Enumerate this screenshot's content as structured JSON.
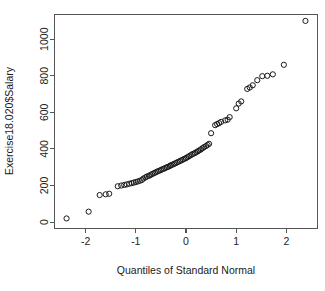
{
  "figure": {
    "background_color": "#ffffff",
    "axis_color": "#555555",
    "point_color": "#1a1a1a",
    "point_radius_px": 2.6
  },
  "axes": {
    "y_title": "Exercise18.020$Salary",
    "x_title": "Quantiles of Standard Normal",
    "x_ticks": [
      "-2",
      "-1",
      "0",
      "1",
      "2"
    ],
    "y_ticks": [
      "0",
      "200",
      "400",
      "600",
      "800",
      "1000"
    ]
  },
  "chart_data": {
    "type": "scatter",
    "title": "",
    "subtitle": "",
    "xlabel": "Quantiles of Standard Normal",
    "ylabel": "Exercise18.020$Salary",
    "xlim": [
      -2.62,
      2.62
    ],
    "ylim": [
      -35,
      1135
    ],
    "xticks": [
      -2,
      -1,
      0,
      1,
      2
    ],
    "yticks": [
      0,
      200,
      400,
      600,
      800,
      1000
    ],
    "grid": false,
    "legend": null,
    "marker": "open-circle",
    "annotations": [],
    "series": [
      {
        "name": "Salary quantiles",
        "n_points": 73,
        "x": [
          -2.38,
          -1.94,
          -1.72,
          -1.6,
          -1.53,
          -1.36,
          -1.29,
          -1.23,
          -1.18,
          -1.13,
          -1.08,
          -1.04,
          -1.0,
          -0.96,
          -0.92,
          -0.88,
          -0.85,
          -0.81,
          -0.78,
          -0.74,
          -0.71,
          -0.68,
          -0.65,
          -0.62,
          -0.59,
          -0.56,
          -0.53,
          -0.5,
          -0.47,
          -0.44,
          -0.41,
          -0.38,
          -0.35,
          -0.32,
          -0.3,
          -0.27,
          -0.24,
          -0.21,
          -0.18,
          -0.15,
          -0.12,
          -0.09,
          -0.06,
          -0.03,
          0.0,
          0.03,
          0.06,
          0.09,
          0.12,
          0.15,
          0.18,
          0.21,
          0.24,
          0.27,
          0.3,
          0.33,
          0.36,
          0.4,
          0.43,
          0.46,
          0.5,
          0.58,
          0.62,
          0.66,
          0.7,
          0.78,
          0.83,
          0.87,
          1.0,
          1.05,
          1.1,
          1.22,
          1.27,
          1.33,
          1.42,
          1.52,
          1.62,
          1.73,
          1.95,
          2.38
        ],
        "y": [
          20,
          57,
          148,
          152,
          155,
          196,
          200,
          203,
          206,
          210,
          213,
          216,
          219,
          222,
          226,
          230,
          238,
          244,
          249,
          253,
          257,
          262,
          266,
          270,
          274,
          278,
          281,
          285,
          289,
          292,
          296,
          300,
          303,
          307,
          311,
          314,
          318,
          322,
          326,
          330,
          334,
          338,
          342,
          346,
          350,
          355,
          360,
          365,
          370,
          374,
          378,
          383,
          388,
          393,
          398,
          404,
          410,
          416,
          422,
          428,
          486,
          530,
          536,
          541,
          548,
          556,
          560,
          574,
          622,
          648,
          660,
          728,
          736,
          748,
          776,
          798,
          800,
          808,
          860,
          1100
        ]
      }
    ]
  }
}
